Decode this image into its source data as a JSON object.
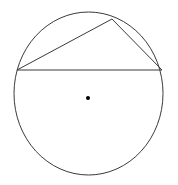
{
  "figure": {
    "canvas": {
      "width": 178,
      "height": 185,
      "background": "#ffffff"
    },
    "stroke_color": "#3a3a3a",
    "stroke_width": 1,
    "dot_color": "#000000",
    "circle": {
      "name": "circle-outline",
      "center_x": 88.5,
      "center_y": 93.5,
      "radius_x": 74.5,
      "radius_y": 81.5
    },
    "center_point": {
      "name": "center-dot",
      "x": 88,
      "y": 98,
      "size": 4
    },
    "triangle": {
      "name": "inscribed-triangle",
      "vertices": [
        {
          "label": "left-vertex",
          "x": 17,
          "y": 70
        },
        {
          "label": "top-vertex",
          "x": 112,
          "y": 19
        },
        {
          "label": "right-vertex",
          "x": 162,
          "y": 70
        }
      ],
      "points_attr": "17,70 112,19 162,70",
      "sides": [
        {
          "name": "chord-left-to-top",
          "x1": 17,
          "y1": 70,
          "x2": 112,
          "y2": 19
        },
        {
          "name": "chord-top-to-right",
          "x1": 112,
          "y1": 19,
          "x2": 162,
          "y2": 70
        },
        {
          "name": "chord-left-to-right",
          "x1": 17,
          "y1": 70,
          "x2": 162,
          "y2": 70
        }
      ]
    },
    "labels": []
  }
}
